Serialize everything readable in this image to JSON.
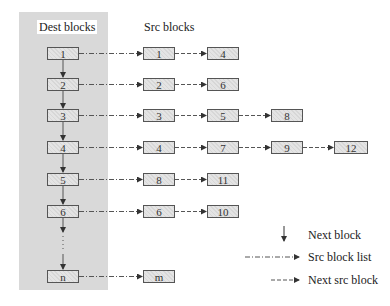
{
  "headers": {
    "dest": "Dest blocks",
    "src": "Src blocks"
  },
  "rows": [
    {
      "dest": "1",
      "src": [
        "1",
        "4"
      ]
    },
    {
      "dest": "2",
      "src": [
        "2",
        "6"
      ]
    },
    {
      "dest": "3",
      "src": [
        "3",
        "5",
        "8"
      ]
    },
    {
      "dest": "4",
      "src": [
        "4",
        "7",
        "9",
        "12"
      ]
    },
    {
      "dest": "5",
      "src": [
        "8",
        "11"
      ]
    },
    {
      "dest": "6",
      "src": [
        "6",
        "10"
      ]
    },
    {
      "dest": "n",
      "src": [
        "m"
      ]
    }
  ],
  "ellipsis": "⋮",
  "legend": {
    "next_block": "Next block",
    "src_block_list": "Src block list",
    "next_src_block": "Next src block"
  },
  "colors": {
    "panel": "#d9d9d9",
    "box_fill": "#e4e4e4",
    "line": "#444444"
  }
}
